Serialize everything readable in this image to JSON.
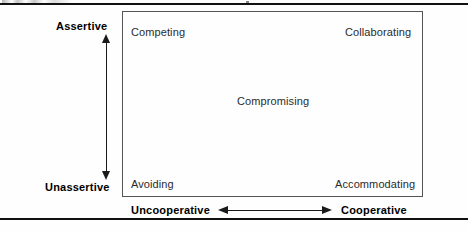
{
  "figure": {
    "type": "2x2-conflict-mode-grid",
    "rules": {
      "top_visible": true,
      "bottom_visible": true
    }
  },
  "axes": {
    "vertical": {
      "high_label": "Assertive",
      "low_label": "Unassertive",
      "arrow": "double-headed-vertical-arrow"
    },
    "horizontal": {
      "low_label": "Uncooperative",
      "high_label": "Cooperative",
      "arrow": "double-headed-horizontal-arrow"
    }
  },
  "modes": {
    "top_left": "Competing",
    "top_right": "Collaborating",
    "center": "Compromising",
    "bottom_left": "Avoiding",
    "bottom_right": "Accommodating"
  },
  "colors": {
    "page_background": "#fefefe",
    "rule": "#111111",
    "box_border": "#555555",
    "mode_text": "#2b2b2b",
    "axis_text": "#000000",
    "arrow": "#1a1a1a"
  }
}
